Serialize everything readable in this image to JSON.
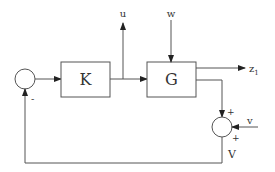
{
  "blocks": {
    "controller": "K",
    "plant": "G"
  },
  "signals": {
    "control": "u",
    "disturbance": "w",
    "output": "z",
    "output_sub": "1",
    "noise": "v",
    "measurement": "V"
  },
  "signs": {
    "feedback": "-",
    "sum_top": "+",
    "sum_bottom": "+"
  }
}
